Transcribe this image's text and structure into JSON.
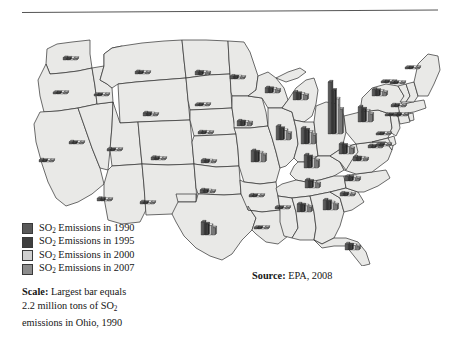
{
  "figure": {
    "kind": "thematic-map",
    "source_note_label": "Source:",
    "source_note_value": " EPA, 2008",
    "scale_label": "Scale:",
    "scale_text_line1": " Largest bar equals",
    "scale_text_line2_a": "2.2 million tons of SO",
    "scale_text_line2_sub": "2",
    "scale_text_line3": "emissions in Ohio, 1990"
  },
  "legend": {
    "position": "bottom-left",
    "items": [
      {
        "label_a": "SO",
        "label_sub": "2",
        "label_b": " Emissions in 1990",
        "year": 1990,
        "color": "#595959"
      },
      {
        "label_a": "SO",
        "label_sub": "2",
        "label_b": " Emissions in 1995",
        "year": 1995,
        "color": "#3f3f3f"
      },
      {
        "label_a": "SO",
        "label_sub": "2",
        "label_b": " Emissions in 2000",
        "year": 2000,
        "color": "#cfcfcf"
      },
      {
        "label_a": "SO",
        "label_sub": "2",
        "label_b": " Emissions in 2007",
        "year": 2007,
        "color": "#8c8c8c"
      }
    ]
  },
  "colors": {
    "state_fill": "#e9e9e7",
    "state_stroke": "#2e2e2e",
    "page_background": "#ffffff",
    "rule": "#555555",
    "bar_1990": "#595959",
    "bar_1995": "#3f3f3f",
    "bar_2000": "#cfcfcf",
    "bar_2007": "#8c8c8c"
  },
  "chart_data": {
    "type": "bar",
    "title": "",
    "subtitle": "",
    "xlabel": "",
    "ylabel": "",
    "grid": false,
    "legend_position": "bottom-left",
    "units": "million tons of SO2",
    "scale_note": "Largest bar equals 2.2 million tons of SO2 emissions in Ohio, 1990",
    "max_value": 2.2,
    "categories": [
      "1990",
      "1995",
      "2000",
      "2007"
    ],
    "series": [
      {
        "name": "1990",
        "color": "#595959"
      },
      {
        "name": "1995",
        "color": "#3f3f3f"
      },
      {
        "name": "2000",
        "color": "#cfcfcf"
      },
      {
        "name": "2007",
        "color": "#8c8c8c"
      }
    ],
    "states": [
      {
        "state": "WA",
        "x": 70,
        "y": 44,
        "values": [
          0.1,
          0.08,
          0.06,
          0.04
        ]
      },
      {
        "state": "OR",
        "x": 60,
        "y": 78,
        "values": [
          0.07,
          0.06,
          0.05,
          0.03
        ]
      },
      {
        "state": "CA",
        "x": 46,
        "y": 146,
        "values": [
          0.09,
          0.07,
          0.05,
          0.03
        ]
      },
      {
        "state": "NV",
        "x": 76,
        "y": 128,
        "values": [
          0.09,
          0.07,
          0.05,
          0.04
        ]
      },
      {
        "state": "ID",
        "x": 101,
        "y": 80,
        "values": [
          0.05,
          0.04,
          0.03,
          0.02
        ]
      },
      {
        "state": "MT",
        "x": 142,
        "y": 58,
        "values": [
          0.1,
          0.08,
          0.07,
          0.05
        ]
      },
      {
        "state": "WY",
        "x": 150,
        "y": 100,
        "values": [
          0.13,
          0.11,
          0.09,
          0.07
        ]
      },
      {
        "state": "UT",
        "x": 114,
        "y": 135,
        "values": [
          0.08,
          0.06,
          0.05,
          0.04
        ]
      },
      {
        "state": "CO",
        "x": 158,
        "y": 144,
        "values": [
          0.11,
          0.09,
          0.07,
          0.05
        ]
      },
      {
        "state": "AZ",
        "x": 104,
        "y": 185,
        "values": [
          0.11,
          0.09,
          0.07,
          0.05
        ]
      },
      {
        "state": "NM",
        "x": 147,
        "y": 188,
        "values": [
          0.09,
          0.07,
          0.06,
          0.04
        ]
      },
      {
        "state": "ND",
        "x": 202,
        "y": 59,
        "values": [
          0.14,
          0.12,
          0.11,
          0.09
        ]
      },
      {
        "state": "SD",
        "x": 202,
        "y": 90,
        "values": [
          0.05,
          0.04,
          0.03,
          0.03
        ]
      },
      {
        "state": "NE",
        "x": 205,
        "y": 118,
        "values": [
          0.09,
          0.08,
          0.07,
          0.06
        ]
      },
      {
        "state": "KS",
        "x": 208,
        "y": 147,
        "values": [
          0.12,
          0.1,
          0.09,
          0.07
        ]
      },
      {
        "state": "OK",
        "x": 207,
        "y": 177,
        "values": [
          0.13,
          0.11,
          0.09,
          0.07
        ]
      },
      {
        "state": "TX",
        "x": 208,
        "y": 219,
        "values": [
          0.55,
          0.47,
          0.4,
          0.31
        ]
      },
      {
        "state": "MN",
        "x": 237,
        "y": 63,
        "values": [
          0.12,
          0.1,
          0.09,
          0.07
        ]
      },
      {
        "state": "IA",
        "x": 244,
        "y": 110,
        "values": [
          0.21,
          0.18,
          0.16,
          0.13
        ]
      },
      {
        "state": "MO",
        "x": 258,
        "y": 146,
        "values": [
          0.48,
          0.42,
          0.38,
          0.3
        ]
      },
      {
        "state": "AR",
        "x": 256,
        "y": 181,
        "values": [
          0.08,
          0.07,
          0.06,
          0.05
        ]
      },
      {
        "state": "LA",
        "x": 261,
        "y": 213,
        "values": [
          0.07,
          0.06,
          0.05,
          0.04
        ]
      },
      {
        "state": "WI",
        "x": 272,
        "y": 77,
        "values": [
          0.22,
          0.19,
          0.16,
          0.12
        ]
      },
      {
        "state": "IL",
        "x": 283,
        "y": 124,
        "values": [
          0.58,
          0.49,
          0.4,
          0.28
        ]
      },
      {
        "state": "MI",
        "x": 300,
        "y": 84,
        "values": [
          0.33,
          0.28,
          0.24,
          0.19
        ]
      },
      {
        "state": "IN",
        "x": 308,
        "y": 128,
        "values": [
          0.67,
          0.59,
          0.5,
          0.37
        ]
      },
      {
        "state": "KY",
        "x": 311,
        "y": 152,
        "values": [
          0.55,
          0.48,
          0.42,
          0.31
        ]
      },
      {
        "state": "TN",
        "x": 312,
        "y": 172,
        "values": [
          0.34,
          0.29,
          0.25,
          0.18
        ]
      },
      {
        "state": "MS",
        "x": 282,
        "y": 193,
        "values": [
          0.08,
          0.07,
          0.06,
          0.05
        ]
      },
      {
        "state": "AL",
        "x": 304,
        "y": 196,
        "values": [
          0.34,
          0.3,
          0.26,
          0.2
        ]
      },
      {
        "state": "GA",
        "x": 330,
        "y": 194,
        "values": [
          0.42,
          0.36,
          0.3,
          0.22
        ]
      },
      {
        "state": "FL",
        "x": 352,
        "y": 234,
        "values": [
          0.26,
          0.22,
          0.19,
          0.14
        ]
      },
      {
        "state": "SC",
        "x": 347,
        "y": 180,
        "values": [
          0.12,
          0.1,
          0.09,
          0.07
        ]
      },
      {
        "state": "NC",
        "x": 352,
        "y": 165,
        "values": [
          0.19,
          0.16,
          0.14,
          0.11
        ]
      },
      {
        "state": "OH",
        "x": 335,
        "y": 118,
        "values": [
          2.2,
          1.85,
          1.48,
          1.05
        ]
      },
      {
        "state": "WV",
        "x": 346,
        "y": 138,
        "values": [
          0.43,
          0.37,
          0.31,
          0.23
        ]
      },
      {
        "state": "VA",
        "x": 360,
        "y": 145,
        "values": [
          0.17,
          0.14,
          0.12,
          0.09
        ]
      },
      {
        "state": "PA",
        "x": 365,
        "y": 106,
        "values": [
          0.64,
          0.55,
          0.46,
          0.33
        ]
      },
      {
        "state": "NY",
        "x": 379,
        "y": 80,
        "values": [
          0.28,
          0.24,
          0.2,
          0.15
        ]
      },
      {
        "state": "MD",
        "x": 375,
        "y": 132,
        "values": [
          0.1,
          0.08,
          0.07,
          0.05
        ]
      },
      {
        "state": "NJ",
        "x": 383,
        "y": 119,
        "values": [
          0.06,
          0.05,
          0.04,
          0.03
        ]
      },
      {
        "state": "CT",
        "x": 392,
        "y": 100,
        "values": [
          0.05,
          0.04,
          0.04,
          0.03
        ]
      },
      {
        "state": "MA",
        "x": 398,
        "y": 91,
        "values": [
          0.09,
          0.08,
          0.06,
          0.05
        ]
      },
      {
        "state": "VT",
        "x": 388,
        "y": 67,
        "values": [
          0.04,
          0.03,
          0.03,
          0.02
        ]
      },
      {
        "state": "NH",
        "x": 397,
        "y": 68,
        "values": [
          0.05,
          0.04,
          0.03,
          0.03
        ]
      },
      {
        "state": "ME",
        "x": 412,
        "y": 53,
        "values": [
          0.06,
          0.05,
          0.04,
          0.03
        ]
      },
      {
        "state": "DE",
        "x": 383,
        "y": 130,
        "values": [
          0.04,
          0.03,
          0.03,
          0.02
        ]
      },
      {
        "state": "RI",
        "x": 400,
        "y": 100,
        "values": [
          0.03,
          0.03,
          0.02,
          0.02
        ]
      }
    ]
  }
}
